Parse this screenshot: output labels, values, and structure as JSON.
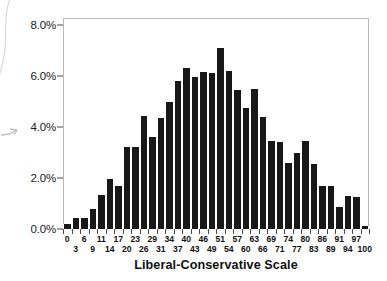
{
  "chart_data": {
    "type": "bar",
    "title": "",
    "xlabel": "Liberal-Conservative Scale",
    "ylabel": "",
    "ylim": [
      0,
      8
    ],
    "ytick_values": [
      0,
      2,
      4,
      6,
      8
    ],
    "ytick_labels": [
      "0.0%",
      "2.0%",
      "4.0%",
      "6.0%",
      "8.0%"
    ],
    "grid": false,
    "legend": null,
    "bar_color": "#181818",
    "categories": [
      "0",
      "3",
      "6",
      "9",
      "11",
      "14",
      "17",
      "20",
      "23",
      "26",
      "29",
      "31",
      "34",
      "37",
      "40",
      "43",
      "46",
      "49",
      "51",
      "54",
      "57",
      "60",
      "63",
      "66",
      "69",
      "71",
      "74",
      "77",
      "80",
      "83",
      "86",
      "89",
      "91",
      "94",
      "97",
      "100"
    ],
    "values": [
      0.2,
      0.45,
      0.45,
      0.8,
      1.35,
      1.95,
      1.7,
      3.2,
      3.2,
      4.45,
      3.6,
      4.35,
      5.0,
      5.8,
      6.3,
      5.95,
      6.15,
      6.1,
      7.1,
      6.2,
      5.45,
      4.75,
      5.5,
      4.4,
      3.45,
      3.4,
      2.6,
      3.0,
      3.45,
      2.55,
      1.7,
      1.7,
      0.85,
      1.3,
      1.25,
      0.1
    ]
  },
  "axes": {
    "y_tick_labels": [
      "8.0%",
      "6.0%",
      "4.0%",
      "2.0%",
      "0.0%"
    ],
    "x_title": "Liberal-Conservative Scale"
  },
  "artifacts": {
    "curve_name": "scan-curve-artifact",
    "arrow_name": "scan-arrow-artifact"
  }
}
